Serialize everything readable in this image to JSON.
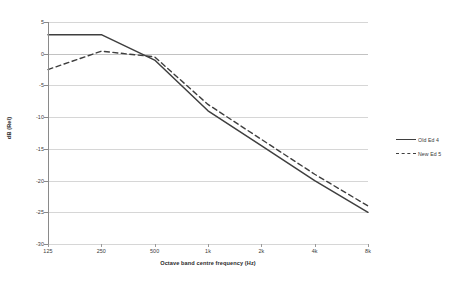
{
  "chart_data": {
    "type": "line",
    "title": "",
    "xlabel": "Octave band centre frequency (Hz)",
    "ylabel": "dB (Rel)",
    "categories": [
      "125",
      "250",
      "500",
      "1k",
      "2k",
      "4k",
      "8k"
    ],
    "ylim": [
      -30,
      5
    ],
    "yticks": [
      "5",
      "0",
      "-5",
      "-10",
      "-15",
      "-20",
      "-25",
      "-30"
    ],
    "ytick_values": [
      5,
      0,
      -5,
      -10,
      -15,
      -20,
      -25,
      -30
    ],
    "grid": true,
    "legend_position": "right",
    "series": [
      {
        "name": "Old Ed 4",
        "style": "solid",
        "color": "#3f3f3f",
        "values": [
          3,
          3,
          -1,
          -9,
          -14.5,
          -20,
          -25
        ]
      },
      {
        "name": "New Ed 5",
        "style": "dashed",
        "color": "#3f3f3f",
        "values": [
          -2.5,
          0.4,
          -0.5,
          -8,
          -13.5,
          -19,
          -24
        ]
      }
    ]
  },
  "legend": {
    "entries": [
      {
        "label": "Old Ed 4"
      },
      {
        "label": "New Ed 5"
      }
    ]
  },
  "colors": {
    "series_line": "#3f3f3f",
    "gridline": "#d6d6d6",
    "axis": "#8a8a8a",
    "background": "#ffffff",
    "text": "#3a3a3a"
  }
}
